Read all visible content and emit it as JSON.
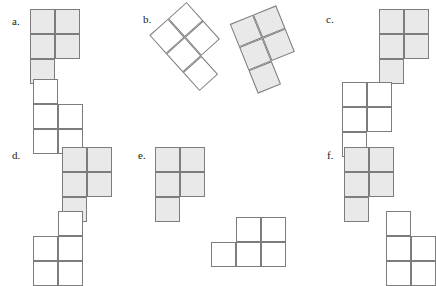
{
  "page": {
    "width": 428,
    "height": 283,
    "background": "#ffffff"
  },
  "style": {
    "cell_size": 25,
    "fill_color": "#e9e9e9",
    "blank_color": "#ffffff",
    "stroke_color": "#7d7d7d",
    "label_color": "#1a1a1a",
    "label_font_size": 11
  },
  "items": [
    {
      "id": "a",
      "label": "a.",
      "label_x": 12,
      "label_y": 16,
      "shapes": [
        {
          "name": "shape-a-top",
          "fill": "filled",
          "x": 30,
          "y": 9,
          "rotation": 0,
          "cells": [
            [
              0,
              0
            ],
            [
              1,
              0
            ],
            [
              0,
              1
            ],
            [
              1,
              1
            ],
            [
              0,
              2
            ]
          ]
        },
        {
          "name": "shape-a-bottom",
          "fill": "blank",
          "x": 33,
          "y": 79,
          "rotation": 0,
          "cells": [
            [
              0,
              0
            ],
            [
              0,
              1
            ],
            [
              1,
              1
            ],
            [
              0,
              2
            ],
            [
              1,
              2
            ]
          ]
        }
      ]
    },
    {
      "id": "b",
      "label": "b.",
      "label_x": 143,
      "label_y": 14,
      "shapes": [
        {
          "name": "shape-b-top-left",
          "fill": "blank",
          "x": 168,
          "y": 9,
          "rotation": -42,
          "cells": [
            [
              0,
              0
            ],
            [
              1,
              0
            ],
            [
              0,
              1
            ],
            [
              1,
              1
            ],
            [
              0,
              2
            ]
          ]
        },
        {
          "name": "shape-b-top-right",
          "fill": "filled",
          "x": 242,
          "y": 12,
          "rotation": -22,
          "cells": [
            [
              0,
              0
            ],
            [
              1,
              0
            ],
            [
              0,
              1
            ],
            [
              1,
              1
            ],
            [
              0,
              2
            ]
          ]
        }
      ]
    },
    {
      "id": "c",
      "label": "c.",
      "label_x": 326,
      "label_y": 14,
      "shapes": [
        {
          "name": "shape-c-top",
          "fill": "filled",
          "x": 379,
          "y": 9,
          "rotation": 0,
          "cells": [
            [
              0,
              0
            ],
            [
              1,
              0
            ],
            [
              0,
              1
            ],
            [
              1,
              1
            ],
            [
              0,
              2
            ]
          ]
        },
        {
          "name": "shape-c-bottom",
          "fill": "blank",
          "x": 342,
          "y": 82,
          "rotation": 0,
          "cells": [
            [
              0,
              0
            ],
            [
              1,
              0
            ],
            [
              0,
              1
            ],
            [
              1,
              1
            ],
            [
              0,
              2
            ]
          ]
        }
      ]
    },
    {
      "id": "d",
      "label": "d.",
      "label_x": 12,
      "label_y": 150,
      "shapes": [
        {
          "name": "shape-d-top",
          "fill": "filled",
          "x": 62,
          "y": 147,
          "rotation": 0,
          "cells": [
            [
              0,
              0
            ],
            [
              1,
              0
            ],
            [
              0,
              1
            ],
            [
              1,
              1
            ],
            [
              0,
              2
            ]
          ]
        },
        {
          "name": "shape-d-bottom",
          "fill": "blank",
          "x": 33,
          "y": 211,
          "rotation": 0,
          "cells": [
            [
              1,
              0
            ],
            [
              0,
              1
            ],
            [
              1,
              1
            ],
            [
              0,
              2
            ],
            [
              1,
              2
            ]
          ]
        }
      ]
    },
    {
      "id": "e",
      "label": "e.",
      "label_x": 138,
      "label_y": 150,
      "shapes": [
        {
          "name": "shape-e-top",
          "fill": "filled",
          "x": 155,
          "y": 147,
          "rotation": 0,
          "cells": [
            [
              0,
              0
            ],
            [
              1,
              0
            ],
            [
              0,
              1
            ],
            [
              1,
              1
            ],
            [
              0,
              2
            ]
          ]
        },
        {
          "name": "shape-e-bottom",
          "fill": "blank",
          "x": 211,
          "y": 217,
          "rotation": 0,
          "cells": [
            [
              1,
              0
            ],
            [
              2,
              0
            ],
            [
              0,
              1
            ],
            [
              1,
              1
            ],
            [
              2,
              1
            ]
          ]
        }
      ]
    },
    {
      "id": "f",
      "label": "f.",
      "label_x": 327,
      "label_y": 150,
      "shapes": [
        {
          "name": "shape-f-top",
          "fill": "filled",
          "x": 344,
          "y": 147,
          "rotation": 0,
          "cells": [
            [
              0,
              0
            ],
            [
              1,
              0
            ],
            [
              0,
              1
            ],
            [
              1,
              1
            ],
            [
              0,
              2
            ]
          ]
        },
        {
          "name": "shape-f-bottom",
          "fill": "blank",
          "x": 386,
          "y": 211,
          "rotation": 0,
          "cells": [
            [
              0,
              0
            ],
            [
              0,
              1
            ],
            [
              1,
              1
            ],
            [
              0,
              2
            ],
            [
              1,
              2
            ]
          ]
        }
      ]
    }
  ]
}
